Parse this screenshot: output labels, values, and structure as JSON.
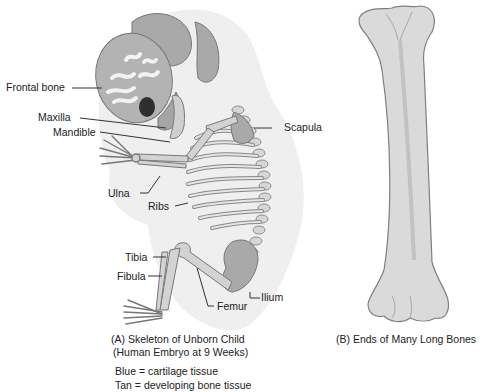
{
  "figure_a": {
    "labels": {
      "frontal_bone": "Frontal bone",
      "maxilla": "Maxilla",
      "mandible": "Mandible",
      "scapula": "Scapula",
      "ulna": "Ulna",
      "ribs": "Ribs",
      "tibia": "Tibia",
      "fibula": "Fibula",
      "ilium": "Ilium",
      "femur": "Femur"
    },
    "caption_line1": "(A) Skeleton of Unborn Child",
    "caption_line2": "(Human Embryo at 9 Weeks)",
    "legend": [
      "Blue = cartilage tissue",
      "Tan = developing bone tissue"
    ]
  },
  "figure_b": {
    "caption": "(B) Ends of Many Long Bones"
  }
}
